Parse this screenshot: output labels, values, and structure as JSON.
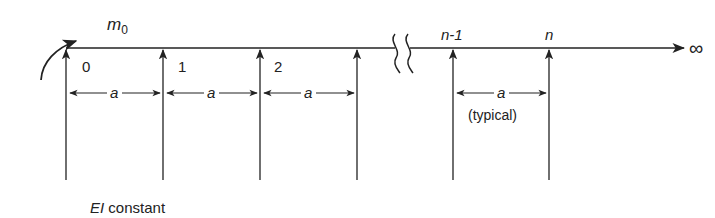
{
  "diagram": {
    "type": "continuous beam on infinite equally spaced supports",
    "moment_label": "m",
    "moment_subscript": "0",
    "supports": [
      {
        "label": "0",
        "x": 66
      },
      {
        "label": "1",
        "x": 163
      },
      {
        "label": "2",
        "x": 260
      },
      {
        "label": "",
        "x": 357
      },
      {
        "label": "n-1",
        "x": 453
      },
      {
        "label": "n",
        "x": 549
      }
    ],
    "spacing_label": "a",
    "typical_label": "(typical)",
    "infinity_label": "∞",
    "stiffness_label_italic": "EI",
    "stiffness_label_rest": " constant",
    "colors": {
      "line": "#222222",
      "background": "#ffffff"
    }
  }
}
